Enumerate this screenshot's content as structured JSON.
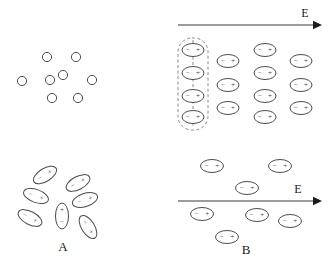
{
  "figure": {
    "width": 330,
    "height": 269,
    "background_color": "#ffffff",
    "stroke_color": "#4d4d4d",
    "text_color": "#1a1a1a",
    "dashed_color": "#8a8a8a"
  },
  "glyphs": {
    "minus": "−",
    "plus": "+"
  },
  "panels": [
    {
      "id": "top-left",
      "name": "nonpolar-no-field",
      "label": "",
      "description": "Nonpolar molecules with no applied field, drawn as plain circles",
      "has_field_arrow": false
    },
    {
      "id": "top-right",
      "name": "nonpolar-with-field",
      "label": "",
      "description": "Nonpolar molecules polarized by the applied field, drawn as ellipses with minus and plus ends",
      "has_field_arrow": true
    },
    {
      "id": "bottom-left",
      "name": "polar-no-field",
      "label": "A",
      "description": "Polar molecules randomly oriented with no applied field",
      "has_field_arrow": false
    },
    {
      "id": "bottom-right",
      "name": "polar-with-field",
      "label": "B",
      "description": "Polar molecules aligned with the applied field",
      "has_field_arrow": true
    }
  ],
  "field_arrows": [
    {
      "id": "field-arrow-top",
      "label": "E",
      "x1": 178,
      "x2": 322,
      "y": 25,
      "label_x": 305,
      "label_y": 13
    },
    {
      "id": "field-arrow-bottom",
      "label": "E",
      "x1": 178,
      "x2": 322,
      "y": 201,
      "label_x": 298,
      "label_y": 189
    }
  ],
  "panel_labels": [
    {
      "id": "label-a",
      "text": "A",
      "x": 63,
      "y": 246
    },
    {
      "id": "label-b",
      "text": "B",
      "x": 246,
      "y": 249
    }
  ],
  "neutral_molecules": [
    {
      "cx": 47,
      "cy": 57,
      "r": 4.6
    },
    {
      "cx": 76,
      "cy": 57,
      "r": 4.6
    },
    {
      "cx": 22,
      "cy": 81,
      "r": 4.6
    },
    {
      "cx": 50,
      "cy": 80,
      "r": 4.6
    },
    {
      "cx": 63,
      "cy": 75,
      "r": 4.6
    },
    {
      "cx": 92,
      "cy": 80,
      "r": 4.6
    },
    {
      "cx": 52,
      "cy": 98,
      "r": 4.6
    },
    {
      "cx": 78,
      "cy": 98,
      "r": 4.6
    }
  ],
  "induced_dipoles": [
    {
      "cx": 193,
      "cy": 50,
      "rx": 11,
      "ry": 6.5,
      "boxed": true
    },
    {
      "cx": 193,
      "cy": 73,
      "rx": 11,
      "ry": 6.5,
      "boxed": true
    },
    {
      "cx": 193,
      "cy": 96,
      "rx": 11,
      "ry": 6.5,
      "boxed": true
    },
    {
      "cx": 193,
      "cy": 117,
      "rx": 11,
      "ry": 6.5,
      "boxed": true
    },
    {
      "cx": 228,
      "cy": 61,
      "rx": 11,
      "ry": 6.5,
      "boxed": false
    },
    {
      "cx": 228,
      "cy": 85,
      "rx": 11,
      "ry": 6.5,
      "boxed": false
    },
    {
      "cx": 228,
      "cy": 108,
      "rx": 11,
      "ry": 6.5,
      "boxed": false
    },
    {
      "cx": 265,
      "cy": 50,
      "rx": 11,
      "ry": 6.5,
      "boxed": false
    },
    {
      "cx": 265,
      "cy": 73,
      "rx": 11,
      "ry": 6.5,
      "boxed": false
    },
    {
      "cx": 265,
      "cy": 96,
      "rx": 11,
      "ry": 6.5,
      "boxed": false
    },
    {
      "cx": 265,
      "cy": 117,
      "rx": 11,
      "ry": 6.5,
      "boxed": false
    },
    {
      "cx": 301,
      "cy": 61,
      "rx": 11,
      "ry": 6.5,
      "boxed": false
    },
    {
      "cx": 301,
      "cy": 85,
      "rx": 11,
      "ry": 6.5,
      "boxed": false
    },
    {
      "cx": 301,
      "cy": 108,
      "rx": 11,
      "ry": 6.5,
      "boxed": false
    }
  ],
  "dashed_enclosure": {
    "x": 178,
    "y": 38,
    "width": 30,
    "height": 92,
    "rx": 14,
    "axis_x": 193,
    "axis_y1": 40,
    "axis_y2": 128
  },
  "random_dipoles": [
    {
      "cx": 45,
      "cy": 175,
      "rx": 13,
      "ry": 6.5,
      "angle": -32
    },
    {
      "cx": 78,
      "cy": 183,
      "rx": 13,
      "ry": 6.5,
      "angle": -28
    },
    {
      "cx": 36,
      "cy": 196,
      "rx": 13,
      "ry": 6.5,
      "angle": 20
    },
    {
      "cx": 85,
      "cy": 200,
      "rx": 13,
      "ry": 6.5,
      "angle": -18
    },
    {
      "cx": 30,
      "cy": 218,
      "rx": 13,
      "ry": 6.5,
      "angle": 28
    },
    {
      "cx": 62,
      "cy": 216,
      "rx": 6.5,
      "ry": 13,
      "angle": 0
    },
    {
      "cx": 88,
      "cy": 227,
      "rx": 13,
      "ry": 6.5,
      "angle": 58
    }
  ],
  "aligned_dipoles": [
    {
      "cx": 212,
      "cy": 166,
      "rx": 11.5,
      "ry": 6.5
    },
    {
      "cx": 280,
      "cy": 166,
      "rx": 11.5,
      "ry": 6.5
    },
    {
      "cx": 247,
      "cy": 188,
      "rx": 11.5,
      "ry": 6.5
    },
    {
      "cx": 202,
      "cy": 214,
      "rx": 11.5,
      "ry": 6.5
    },
    {
      "cx": 257,
      "cy": 215,
      "rx": 11.5,
      "ry": 6.5
    },
    {
      "cx": 290,
      "cy": 221,
      "rx": 11.5,
      "ry": 6.5
    },
    {
      "cx": 227,
      "cy": 237,
      "rx": 11.5,
      "ry": 6.5
    }
  ]
}
